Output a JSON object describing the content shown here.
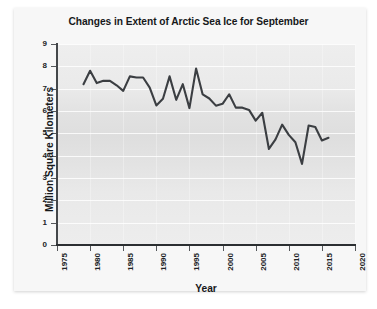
{
  "chart_data": {
    "type": "line",
    "title": "Changes in Extent of Arctic Sea Ice for September",
    "xlabel": "Year",
    "ylabel": "Million Square Kilometers",
    "xlim": [
      1975,
      2020
    ],
    "ylim": [
      0,
      9
    ],
    "xticks": [
      1975,
      1980,
      1985,
      1990,
      1995,
      2000,
      2005,
      2010,
      2015,
      2020
    ],
    "xtick_labels": [
      "1975",
      "1980",
      "1985",
      "1990",
      "1995",
      "2000",
      "2005",
      "2010",
      "2015",
      "2020"
    ],
    "yticks": [
      0,
      1,
      2,
      3,
      4,
      5,
      6,
      7,
      8,
      9
    ],
    "ytick_labels": [
      "0",
      "1",
      "2",
      "3",
      "4",
      "5",
      "6",
      "7",
      "8",
      "9"
    ],
    "grid": "horizontal",
    "legend": "none",
    "line_color": "#3b3e42",
    "plot_background": "#e4e4e4",
    "x": [
      1979,
      1980,
      1981,
      1982,
      1983,
      1984,
      1985,
      1986,
      1987,
      1988,
      1989,
      1990,
      1991,
      1992,
      1993,
      1994,
      1995,
      1996,
      1997,
      1998,
      1999,
      2000,
      2001,
      2002,
      2003,
      2004,
      2005,
      2006,
      2007,
      2008,
      2009,
      2010,
      2011,
      2012,
      2013,
      2014,
      2015,
      2016
    ],
    "values": [
      7.2,
      7.8,
      7.25,
      7.35,
      7.35,
      7.15,
      6.9,
      7.55,
      7.5,
      7.5,
      7.05,
      6.25,
      6.55,
      7.55,
      6.5,
      7.2,
      6.13,
      7.9,
      6.74,
      6.56,
      6.24,
      6.32,
      6.75,
      6.15,
      6.15,
      6.05,
      5.57,
      5.92,
      4.3,
      4.73,
      5.39,
      4.93,
      4.6,
      3.63,
      5.35,
      5.28,
      4.68,
      4.8
    ],
    "annotations": []
  }
}
